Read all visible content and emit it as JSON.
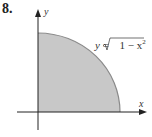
{
  "problem_number": "8.",
  "axes": {
    "x_label": "x",
    "y_label": "y"
  },
  "curve": {
    "equation_lhs": "y",
    "equals": "=",
    "radical_content": "1 − x",
    "exponent": "2"
  },
  "colors": {
    "fill": "#c8c8c8",
    "stroke": "#8a8a8a",
    "axis": "#222222"
  }
}
